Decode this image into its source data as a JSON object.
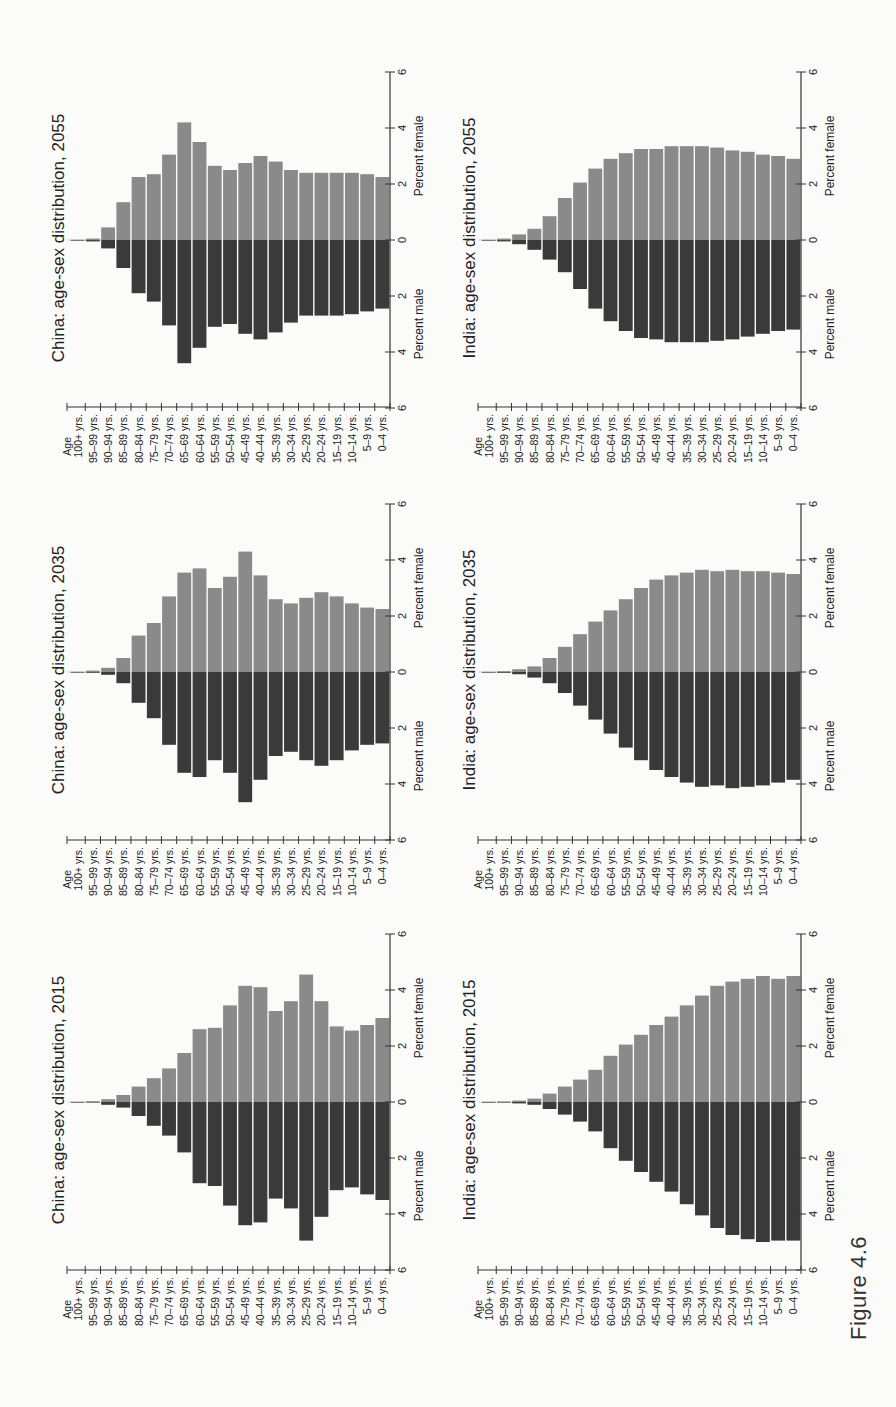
{
  "figure": {
    "caption": "Figure 4.6"
  },
  "colors": {
    "female": "#8a8a8a",
    "male": "#3a3a3a",
    "axis": "#333333",
    "gap": "#fbfbfa"
  },
  "axis_labels": {
    "age": "Age",
    "female": "Percent female",
    "male": "Percent male",
    "ticks": [
      "6",
      "4",
      "2",
      "0",
      "2",
      "4",
      "6"
    ]
  },
  "age_groups": [
    "100+ yrs.",
    "95–99 yrs.",
    "90–94 yrs.",
    "85–89 yrs.",
    "80–84 yrs.",
    "75–79 yrs.",
    "70–74 yrs.",
    "65–69 yrs.",
    "60–64 yrs.",
    "55–59 yrs.",
    "50–54 yrs.",
    "45–49 yrs.",
    "40–44 yrs.",
    "35–39 yrs.",
    "30–34 yrs.",
    "25–29 yrs.",
    "20–24 yrs.",
    "15–19 yrs.",
    "10–14 yrs.",
    "5–9 yrs.",
    "0–4 yrs."
  ],
  "chart_data": [
    {
      "type": "bar",
      "subtype": "population-pyramid",
      "title": "China:  age-sex distribution, 2015",
      "xlabel": "Age",
      "ylabel": "Percent male / Percent female",
      "categories": [
        "100+",
        "95–99",
        "90–94",
        "85–89",
        "80–84",
        "75–79",
        "70–74",
        "65–69",
        "60–64",
        "55–59",
        "50–54",
        "45–49",
        "40–44",
        "35–39",
        "30–34",
        "25–29",
        "20–24",
        "15–19",
        "10–14",
        "5–9",
        "0–4"
      ],
      "series": [
        {
          "name": "Percent male",
          "values": [
            0.01,
            0.02,
            0.1,
            0.2,
            0.5,
            0.85,
            1.2,
            1.8,
            2.9,
            3.0,
            3.7,
            4.4,
            4.3,
            3.45,
            3.8,
            4.95,
            4.1,
            3.15,
            3.05,
            3.3,
            3.5
          ]
        },
        {
          "name": "Percent female",
          "values": [
            0.01,
            0.03,
            0.1,
            0.25,
            0.55,
            0.85,
            1.2,
            1.75,
            2.6,
            2.65,
            3.45,
            4.15,
            4.1,
            3.25,
            3.6,
            4.55,
            3.6,
            2.7,
            2.55,
            2.75,
            3.0
          ]
        }
      ],
      "ylim": [
        -6,
        6
      ],
      "grid": false,
      "position": {
        "row": 3,
        "col": 1
      }
    },
    {
      "type": "bar",
      "subtype": "population-pyramid",
      "title": "China:  age-sex distribution, 2035",
      "xlabel": "Age",
      "ylabel": "Percent male / Percent female",
      "categories": [
        "100+",
        "95–99",
        "90–94",
        "85–89",
        "80–84",
        "75–79",
        "70–74",
        "65–69",
        "60–64",
        "55–59",
        "50–54",
        "45–49",
        "40–44",
        "35–39",
        "30–34",
        "25–29",
        "20–24",
        "15–19",
        "10–14",
        "5–9",
        "0–4"
      ],
      "series": [
        {
          "name": "Percent male",
          "values": [
            0.01,
            0.03,
            0.1,
            0.4,
            1.1,
            1.65,
            2.6,
            3.6,
            3.75,
            3.15,
            3.6,
            4.65,
            3.85,
            3.0,
            2.85,
            3.15,
            3.35,
            3.15,
            2.8,
            2.6,
            2.55
          ]
        },
        {
          "name": "Percent female",
          "values": [
            0.01,
            0.05,
            0.15,
            0.5,
            1.3,
            1.75,
            2.7,
            3.55,
            3.7,
            3.0,
            3.4,
            4.3,
            3.45,
            2.6,
            2.45,
            2.65,
            2.85,
            2.7,
            2.45,
            2.3,
            2.25
          ]
        }
      ],
      "ylim": [
        -6,
        6
      ],
      "grid": false,
      "position": {
        "row": 2,
        "col": 1
      }
    },
    {
      "type": "bar",
      "subtype": "population-pyramid",
      "title": "China:  age-sex distribution, 2055",
      "xlabel": "Age",
      "ylabel": "Percent male / Percent female",
      "categories": [
        "100+",
        "95–99",
        "90–94",
        "85–89",
        "80–84",
        "75–79",
        "70–74",
        "65–69",
        "60–64",
        "55–59",
        "50–54",
        "45–49",
        "40–44",
        "35–39",
        "30–34",
        "25–29",
        "20–24",
        "15–19",
        "10–14",
        "5–9",
        "0–4"
      ],
      "series": [
        {
          "name": "Percent male",
          "values": [
            0.01,
            0.05,
            0.3,
            1.0,
            1.9,
            2.2,
            3.05,
            4.4,
            3.85,
            3.1,
            3.0,
            3.35,
            3.55,
            3.3,
            2.95,
            2.7,
            2.7,
            2.7,
            2.65,
            2.55,
            2.45
          ]
        },
        {
          "name": "Percent female",
          "values": [
            0.01,
            0.05,
            0.45,
            1.35,
            2.25,
            2.35,
            3.05,
            4.2,
            3.5,
            2.65,
            2.5,
            2.75,
            3.0,
            2.8,
            2.5,
            2.4,
            2.4,
            2.4,
            2.4,
            2.35,
            2.25
          ]
        }
      ],
      "ylim": [
        -6,
        6
      ],
      "grid": false,
      "position": {
        "row": 1,
        "col": 1
      }
    },
    {
      "type": "bar",
      "subtype": "population-pyramid",
      "title": "India:  age-sex distribution, 2015",
      "xlabel": "Age",
      "ylabel": "Percent male / Percent female",
      "categories": [
        "100+",
        "95–99",
        "90–94",
        "85–89",
        "80–84",
        "75–79",
        "70–74",
        "65–69",
        "60–64",
        "55–59",
        "50–54",
        "45–49",
        "40–44",
        "35–39",
        "30–34",
        "25–29",
        "20–24",
        "15–19",
        "10–14",
        "5–9",
        "0–4"
      ],
      "series": [
        {
          "name": "Percent male",
          "values": [
            0.01,
            0.02,
            0.05,
            0.1,
            0.25,
            0.45,
            0.7,
            1.05,
            1.65,
            2.1,
            2.5,
            2.85,
            3.2,
            3.65,
            4.05,
            4.5,
            4.75,
            4.9,
            5.0,
            4.95,
            4.95
          ]
        },
        {
          "name": "Percent female",
          "values": [
            0.01,
            0.02,
            0.05,
            0.12,
            0.3,
            0.55,
            0.8,
            1.15,
            1.65,
            2.05,
            2.4,
            2.75,
            3.05,
            3.45,
            3.8,
            4.15,
            4.3,
            4.4,
            4.5,
            4.4,
            4.5
          ]
        }
      ],
      "ylim": [
        -6,
        6
      ],
      "grid": false,
      "position": {
        "row": 3,
        "col": 2
      }
    },
    {
      "type": "bar",
      "subtype": "population-pyramid",
      "title": "India:  age-sex distribution, 2035",
      "xlabel": "Age",
      "ylabel": "Percent male / Percent female",
      "categories": [
        "100+",
        "95–99",
        "90–94",
        "85–89",
        "80–84",
        "75–79",
        "70–74",
        "65–69",
        "60–64",
        "55–59",
        "50–54",
        "45–49",
        "40–44",
        "35–39",
        "30–34",
        "25–29",
        "20–24",
        "15–19",
        "10–14",
        "5–9",
        "0–4"
      ],
      "series": [
        {
          "name": "Percent male",
          "values": [
            0.01,
            0.03,
            0.08,
            0.2,
            0.4,
            0.75,
            1.2,
            1.7,
            2.2,
            2.7,
            3.15,
            3.5,
            3.75,
            3.95,
            4.1,
            4.05,
            4.15,
            4.1,
            4.05,
            3.95,
            3.85
          ]
        },
        {
          "name": "Percent female",
          "values": [
            0.01,
            0.03,
            0.1,
            0.2,
            0.5,
            0.9,
            1.35,
            1.8,
            2.2,
            2.6,
            3.0,
            3.3,
            3.45,
            3.55,
            3.65,
            3.6,
            3.65,
            3.6,
            3.6,
            3.55,
            3.5
          ]
        }
      ],
      "ylim": [
        -6,
        6
      ],
      "grid": false,
      "position": {
        "row": 2,
        "col": 2
      }
    },
    {
      "type": "bar",
      "subtype": "population-pyramid",
      "title": "India:  age-sex distribution, 2055",
      "xlabel": "Age",
      "ylabel": "Percent male / Percent female",
      "categories": [
        "100+",
        "95–99",
        "90–94",
        "85–89",
        "80–84",
        "75–79",
        "70–74",
        "65–69",
        "60–64",
        "55–59",
        "50–54",
        "45–49",
        "40–44",
        "35–39",
        "30–34",
        "25–29",
        "20–24",
        "15–19",
        "10–14",
        "5–9",
        "0–4"
      ],
      "series": [
        {
          "name": "Percent male",
          "values": [
            0.01,
            0.05,
            0.15,
            0.35,
            0.7,
            1.15,
            1.75,
            2.45,
            2.9,
            3.25,
            3.5,
            3.55,
            3.65,
            3.65,
            3.65,
            3.6,
            3.55,
            3.45,
            3.35,
            3.25,
            3.2
          ]
        },
        {
          "name": "Percent female",
          "values": [
            0.01,
            0.05,
            0.2,
            0.4,
            0.85,
            1.5,
            2.05,
            2.55,
            2.9,
            3.1,
            3.25,
            3.25,
            3.35,
            3.35,
            3.35,
            3.3,
            3.2,
            3.15,
            3.05,
            3.0,
            2.9
          ]
        }
      ],
      "ylim": [
        -6,
        6
      ],
      "grid": false,
      "position": {
        "row": 1,
        "col": 2
      }
    }
  ]
}
